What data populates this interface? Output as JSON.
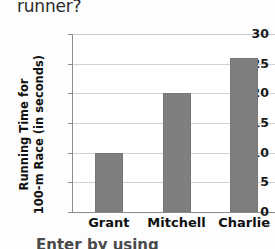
{
  "page": {
    "question_fragment": "runner?",
    "caption_fragment": "Enter by using"
  },
  "chart_data": {
    "type": "bar",
    "title": "",
    "xlabel": "",
    "ylabel": "Running Time for 100-m Race (in seconds)",
    "ylabel_lines": [
      "Running Time for",
      "100-m Race (in seconds)"
    ],
    "categories": [
      "Grant",
      "Mitchell",
      "Charlie"
    ],
    "values": [
      10,
      20,
      26
    ],
    "ylim": [
      0,
      30
    ],
    "yticks": [
      0,
      5,
      10,
      15,
      20,
      25,
      30
    ],
    "ytick_labels": [
      "0",
      "5",
      "10",
      "15",
      "20",
      "25",
      "30"
    ],
    "grid": true,
    "legend": false,
    "bar_color": "#7f7f7f",
    "gridline_color": "#d2d2d2",
    "axis_color": "#8c8c8c",
    "background_color": "#ffffff"
  }
}
